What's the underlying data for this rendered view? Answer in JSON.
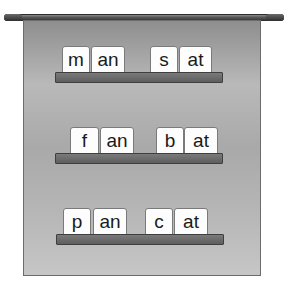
{
  "illustration": {
    "description": "Word-family pocket chart banner with three shelves of letter tiles",
    "rows": [
      {
        "words": [
          {
            "onset": "m",
            "rime": "an"
          },
          {
            "onset": "s",
            "rime": "at"
          }
        ]
      },
      {
        "words": [
          {
            "onset": "f",
            "rime": "an"
          },
          {
            "onset": "b",
            "rime": "at"
          }
        ]
      },
      {
        "words": [
          {
            "onset": "p",
            "rime": "an"
          },
          {
            "onset": "c",
            "rime": "at"
          }
        ]
      }
    ]
  }
}
